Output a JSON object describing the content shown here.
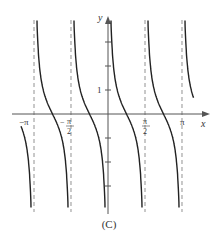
{
  "chart_data": {
    "type": "line",
    "title": "",
    "caption": "(C)",
    "function_shape": "cot(2x)",
    "xlabel": "x",
    "ylabel": "y",
    "xlim": [
      -3.9,
      3.6
    ],
    "ylim": [
      -4,
      4
    ],
    "x_ticks": [
      {
        "value": -3.14159,
        "label": "−π"
      },
      {
        "value": -1.5708,
        "label": "−π/2"
      },
      {
        "value": 1.5708,
        "label": "π/2"
      },
      {
        "value": 3.14159,
        "label": "π"
      }
    ],
    "y_ticks": [
      -3,
      -2,
      -1,
      1,
      2,
      3
    ],
    "y_tick_labels": [
      {
        "value": 1,
        "label": "1"
      }
    ],
    "asymptotes_x": [
      -3.14159,
      -1.5708,
      0,
      1.5708,
      3.14159
    ],
    "grid": false,
    "legend": null
  },
  "labels": {
    "x_axis": "x",
    "y_axis": "y",
    "neg_pi": "−π",
    "neg_pi_half_num": "π",
    "neg_pi_half_den": "2",
    "pi_half_num": "π",
    "pi_half_den": "2",
    "pi": "π",
    "one": "1",
    "caption": "(C)"
  }
}
